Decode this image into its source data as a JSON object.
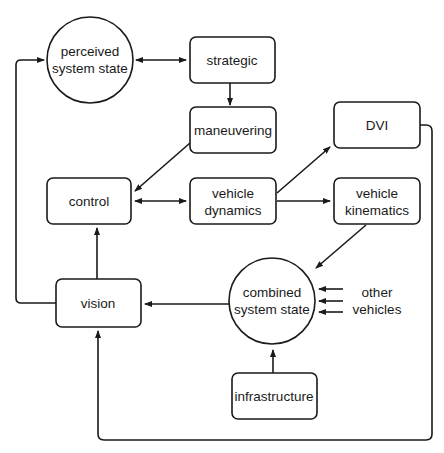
{
  "diagram": {
    "type": "block-flow",
    "colors": {
      "stroke": "#1a1a1a",
      "fill": "#ffffff",
      "text": "#1a1a1a"
    },
    "nodes": {
      "perceived_state": {
        "shape": "circle",
        "line1": "perceived",
        "line2": "system state"
      },
      "strategic": {
        "shape": "rounded-rect",
        "label": "strategic"
      },
      "maneuvering": {
        "shape": "rounded-rect",
        "label": "maneuvering"
      },
      "dvi": {
        "shape": "rounded-rect",
        "label": "DVI"
      },
      "control": {
        "shape": "rounded-rect",
        "label": "control"
      },
      "vehicle_dynamics": {
        "shape": "rounded-rect",
        "line1": "vehicle",
        "line2": "dynamics"
      },
      "vehicle_kinematics": {
        "shape": "rounded-rect",
        "line1": "vehicle",
        "line2": "kinematics"
      },
      "vision": {
        "shape": "rounded-rect",
        "label": "vision"
      },
      "combined_state": {
        "shape": "circle",
        "line1": "combined",
        "line2": "system state"
      },
      "infrastructure": {
        "shape": "rounded-rect",
        "label": "infrastructure"
      },
      "other_vehicles": {
        "shape": "text",
        "line1": "other",
        "line2": "vehicles"
      }
    },
    "edges": [
      {
        "from": "perceived system state",
        "to": "strategic",
        "direction": "bidirectional"
      },
      {
        "from": "strategic",
        "to": "maneuvering",
        "direction": "forward"
      },
      {
        "from": "maneuvering",
        "to": "control",
        "direction": "forward"
      },
      {
        "from": "control",
        "to": "vehicle dynamics",
        "direction": "bidirectional"
      },
      {
        "from": "vehicle dynamics",
        "to": "DVI",
        "direction": "forward"
      },
      {
        "from": "vehicle dynamics",
        "to": "vehicle kinematics",
        "direction": "forward"
      },
      {
        "from": "vehicle kinematics",
        "to": "combined system state",
        "direction": "forward"
      },
      {
        "from": "other vehicles",
        "to": "combined system state",
        "direction": "forward",
        "count": 3
      },
      {
        "from": "infrastructure",
        "to": "combined system state",
        "direction": "forward"
      },
      {
        "from": "combined system state",
        "to": "vision",
        "direction": "forward"
      },
      {
        "from": "vision",
        "to": "control",
        "direction": "forward"
      },
      {
        "from": "vision",
        "to": "perceived system state",
        "direction": "forward"
      },
      {
        "from": "DVI",
        "to": "vision",
        "direction": "forward"
      }
    ]
  }
}
